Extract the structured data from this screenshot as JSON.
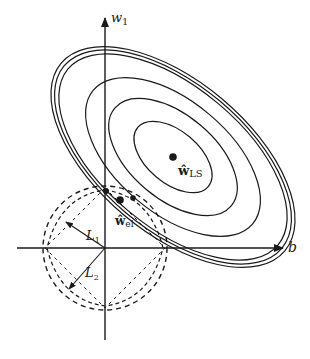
{
  "figure": {
    "type": "geometric regularization diagram",
    "axes": {
      "x_label": "b",
      "y_label_base": "w",
      "y_label_sub": "1",
      "origin": [
        105,
        248
      ]
    },
    "points": {
      "ls": {
        "label_base": "ŵ",
        "label_sub": "LS"
      },
      "el": {
        "label_base": "ŵ",
        "label_sub": "el"
      }
    },
    "norms": {
      "l1": {
        "label_base": "L",
        "label_sub": "1"
      },
      "l2": {
        "label_base": "L",
        "label_sub": "2"
      }
    },
    "colors": {
      "ink": "#1a1a1a",
      "background": "#ffffff"
    }
  }
}
